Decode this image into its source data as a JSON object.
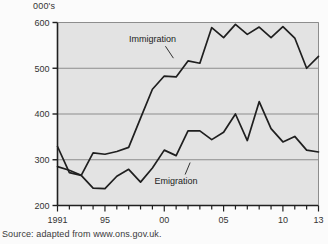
{
  "figure": {
    "unit_label": "000's",
    "source_caption": "Source: adapted from www.ons.gov.uk.",
    "plot_bg_color": "#e3e3e3",
    "line_color": "#1f1f1f",
    "grid_color": "#8d8d8d",
    "axis_color": "#1f1f1f"
  },
  "chart_data": {
    "type": "line",
    "title": "",
    "subtitle": "",
    "xlabel": "",
    "ylabel": "000's",
    "xlim": [
      1991,
      2013
    ],
    "ylim": [
      200,
      600
    ],
    "yticks": [
      200,
      300,
      400,
      500,
      600
    ],
    "ytick_labels": [
      "200",
      "300",
      "400",
      "500",
      "600"
    ],
    "xticks": [
      1991,
      1992,
      1993,
      1994,
      1995,
      1996,
      1997,
      1998,
      1999,
      2000,
      2001,
      2002,
      2003,
      2004,
      2005,
      2006,
      2007,
      2008,
      2009,
      2010,
      2011,
      2012,
      2013
    ],
    "xtick_labels": [
      "1991",
      "",
      "",
      "",
      "95",
      "",
      "",
      "",
      "",
      "00",
      "",
      "",
      "",
      "",
      "05",
      "",
      "",
      "",
      "",
      "10",
      "",
      "",
      "13"
    ],
    "grid": true,
    "grid_axis": "y",
    "legend": "annotated-inline",
    "x": [
      1991,
      1992,
      1993,
      1994,
      1995,
      1996,
      1997,
      1998,
      1999,
      2000,
      2001,
      2002,
      2003,
      2004,
      2005,
      2006,
      2007,
      2008,
      2009,
      2010,
      2011,
      2012,
      2013
    ],
    "series": [
      {
        "name": "Immigration",
        "label": "Immigration",
        "values": [
          329,
          272,
          266,
          315,
          312,
          318,
          327,
          391,
          454,
          483,
          481,
          516,
          511,
          589,
          567,
          596,
          574,
          590,
          567,
          591,
          566,
          500,
          526
        ]
      },
      {
        "name": "Emigration",
        "label": "Emigration",
        "values": [
          285,
          277,
          266,
          238,
          237,
          264,
          279,
          251,
          282,
          321,
          309,
          363,
          363,
          344,
          360,
          400,
          342,
          427,
          368,
          339,
          351,
          321,
          317
        ]
      }
    ],
    "annotations": [
      {
        "text": "Immigration",
        "x_value": 1999,
        "y_value": 557
      },
      {
        "text": "Emigration",
        "x_value": 2001,
        "y_value": 248
      }
    ]
  }
}
